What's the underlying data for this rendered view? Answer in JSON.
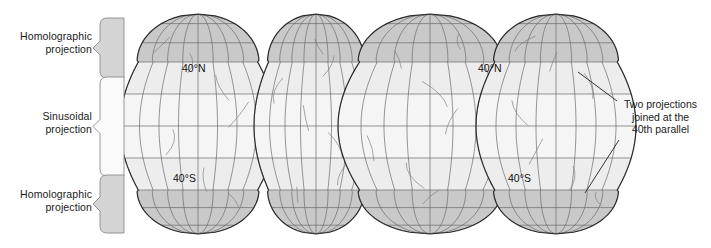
{
  "figure": {
    "width": 711,
    "height": 248,
    "background_color": "#ffffff"
  },
  "brackets": [
    {
      "id": "homolographic-top",
      "label_line1": "Homolographic",
      "label_line2": "projection",
      "fill": "#d4d4d4",
      "stroke": "#8c8c8c",
      "y_top": 18,
      "y_bottom": 78
    },
    {
      "id": "sinusoidal",
      "label_line1": "Sinusoidal",
      "label_line2": "projection",
      "fill": "#fafafa",
      "stroke": "#8c8c8c",
      "y_top": 77,
      "y_bottom": 176
    },
    {
      "id": "homolographic-bottom",
      "label_line1": "Homolographic",
      "label_line2": "projection",
      "fill": "#d4d4d4",
      "stroke": "#8c8c8c",
      "y_top": 175,
      "y_bottom": 233
    }
  ],
  "annotation": {
    "line1": "Two projections",
    "line2": "joined at the",
    "line3": "40th parallel",
    "leader_color": "#333333"
  },
  "graticule_labels": [
    {
      "id": "n40-left",
      "text": "40°N",
      "x": 182,
      "y": 72
    },
    {
      "id": "n40-right",
      "text": "40°N",
      "x": 478,
      "y": 72
    },
    {
      "id": "s40-left",
      "text": "40°S",
      "x": 173,
      "y": 182
    },
    {
      "id": "s40-right",
      "text": "40°S",
      "x": 508,
      "y": 182
    }
  ],
  "map_data": {
    "type": "interrupted-pseudocylindrical",
    "projection_name": "Goode homolosine",
    "lobe_count": 4,
    "latitude_bands": [
      {
        "name": "north-polar",
        "from": 90,
        "to": 40,
        "fill": "#c9c9c9"
      },
      {
        "name": "north-middle",
        "from": 40,
        "to": 20,
        "fill": "#ededed"
      },
      {
        "name": "equatorial",
        "from": 20,
        "to": -20,
        "fill": "#f5f5f5"
      },
      {
        "name": "south-middle",
        "from": -20,
        "to": -40,
        "fill": "#ededed"
      },
      {
        "name": "south-polar",
        "from": -40,
        "to": -90,
        "fill": "#c9c9c9"
      }
    ],
    "graticule": {
      "parallel_color": "#6a6a6a",
      "meridian_color": "#6a6a6a",
      "outline_color": "#2b2b2b",
      "parallel_interval_deg": 20,
      "meridian_interval_deg": 30
    },
    "coastline_color": "#808080",
    "lobes": [
      {
        "id": "lobe-1",
        "center_x": 198,
        "half_width": 78,
        "content": "North America west / Pacific"
      },
      {
        "id": "lobe-2",
        "center_x": 316,
        "half_width": 62,
        "content": "South America / Atlantic"
      },
      {
        "id": "lobe-3",
        "center_x": 430,
        "half_width": 92,
        "content": "Europe / Africa"
      },
      {
        "id": "lobe-4",
        "center_x": 556,
        "half_width": 80,
        "content": "Asia / Australia"
      }
    ]
  }
}
